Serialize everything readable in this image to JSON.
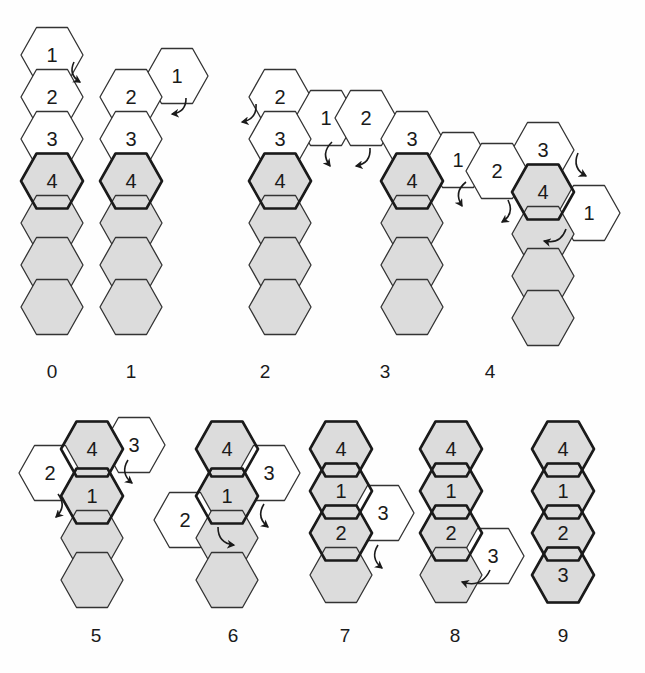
{
  "figure": {
    "background_color": "#fefefe",
    "hex": {
      "width": 62,
      "height": 55,
      "col_step": 46.5,
      "row_step": 41.5,
      "orientation": "flat-top"
    },
    "colors": {
      "shaded_fill": "#dcdcdc",
      "white_fill": "#ffffff",
      "stroke": "#333333",
      "stroke_bold": "#1a1a1a",
      "text": "#1a1a1a"
    },
    "stroke_widths": {
      "normal": 1.3,
      "bold": 2.6
    }
  },
  "panels": [
    {
      "id": "panel-0",
      "label": "0",
      "label_pos": {
        "x": 52,
        "y": 372
      },
      "hexes": [
        {
          "name": "hex-1",
          "text": "1",
          "cx": 52,
          "cy": 55,
          "fill": "white",
          "bold": false
        },
        {
          "name": "hex-2",
          "text": "2",
          "cx": 52,
          "cy": 97,
          "fill": "white",
          "bold": false
        },
        {
          "name": "hex-3",
          "text": "3",
          "cx": 52,
          "cy": 139,
          "fill": "white",
          "bold": false
        },
        {
          "name": "hex-4",
          "text": "4",
          "cx": 52,
          "cy": 181,
          "fill": "shaded",
          "bold": true
        },
        {
          "name": "hex-body-1",
          "text": "",
          "cx": 52,
          "cy": 223,
          "fill": "shaded",
          "bold": false
        },
        {
          "name": "hex-body-2",
          "text": "",
          "cx": 52,
          "cy": 265,
          "fill": "shaded",
          "bold": false
        },
        {
          "name": "hex-body-3",
          "text": "",
          "cx": 52,
          "cy": 307,
          "fill": "shaded",
          "bold": false
        }
      ],
      "arrows": [
        {
          "name": "rotation-arrow",
          "x1": 74,
          "y1": 62,
          "x2": 80,
          "y2": 82,
          "curve": "right-down"
        }
      ]
    },
    {
      "id": "panel-1",
      "label": "1",
      "label_pos": {
        "x": 131,
        "y": 372
      },
      "hexes": [
        {
          "name": "hex-1",
          "text": "1",
          "cx": 177,
          "cy": 76,
          "fill": "white",
          "bold": false
        },
        {
          "name": "hex-2",
          "text": "2",
          "cx": 131,
          "cy": 97,
          "fill": "white",
          "bold": false
        },
        {
          "name": "hex-3",
          "text": "3",
          "cx": 131,
          "cy": 139,
          "fill": "white",
          "bold": false
        },
        {
          "name": "hex-4",
          "text": "4",
          "cx": 131,
          "cy": 181,
          "fill": "shaded",
          "bold": true
        },
        {
          "name": "hex-body-1",
          "text": "",
          "cx": 131,
          "cy": 223,
          "fill": "shaded",
          "bold": false
        },
        {
          "name": "hex-body-2",
          "text": "",
          "cx": 131,
          "cy": 265,
          "fill": "shaded",
          "bold": false
        },
        {
          "name": "hex-body-3",
          "text": "",
          "cx": 131,
          "cy": 307,
          "fill": "shaded",
          "bold": false
        }
      ],
      "arrows": [
        {
          "name": "rotation-arrow",
          "x1": 186,
          "y1": 98,
          "x2": 172,
          "y2": 114,
          "curve": "left-down"
        }
      ]
    },
    {
      "id": "panel-2",
      "label": "2",
      "label_pos": {
        "x": 265,
        "y": 372
      },
      "hexes": [
        {
          "name": "hex-2",
          "text": "2",
          "cx": 280,
          "cy": 97,
          "fill": "white",
          "bold": false
        },
        {
          "name": "hex-1",
          "text": "1",
          "cx": 326,
          "cy": 118,
          "fill": "white",
          "bold": false
        },
        {
          "name": "hex-3",
          "text": "3",
          "cx": 280,
          "cy": 139,
          "fill": "white",
          "bold": false
        },
        {
          "name": "hex-4",
          "text": "4",
          "cx": 280,
          "cy": 181,
          "fill": "shaded",
          "bold": true
        },
        {
          "name": "hex-body-1",
          "text": "",
          "cx": 280,
          "cy": 223,
          "fill": "shaded",
          "bold": false
        },
        {
          "name": "hex-body-2",
          "text": "",
          "cx": 280,
          "cy": 265,
          "fill": "shaded",
          "bold": false
        },
        {
          "name": "hex-body-3",
          "text": "",
          "cx": 280,
          "cy": 307,
          "fill": "shaded",
          "bold": false
        }
      ],
      "arrows": [
        {
          "name": "rotation-arrow-left",
          "x1": 256,
          "y1": 104,
          "x2": 242,
          "y2": 122,
          "curve": "left-down"
        },
        {
          "name": "rotation-arrow-right",
          "x1": 332,
          "y1": 142,
          "x2": 330,
          "y2": 166,
          "curve": "right-down"
        }
      ]
    },
    {
      "id": "panel-3",
      "label": "3",
      "label_pos": {
        "x": 385,
        "y": 372
      },
      "hexes": [
        {
          "name": "hex-2",
          "text": "2",
          "cx": 366,
          "cy": 118,
          "fill": "white",
          "bold": false
        },
        {
          "name": "hex-3",
          "text": "3",
          "cx": 412,
          "cy": 139,
          "fill": "white",
          "bold": false
        },
        {
          "name": "hex-1",
          "text": "1",
          "cx": 458,
          "cy": 160,
          "fill": "white",
          "bold": false
        },
        {
          "name": "hex-4",
          "text": "4",
          "cx": 412,
          "cy": 181,
          "fill": "shaded",
          "bold": true
        },
        {
          "name": "hex-body-1",
          "text": "",
          "cx": 412,
          "cy": 223,
          "fill": "shaded",
          "bold": false
        },
        {
          "name": "hex-body-2",
          "text": "",
          "cx": 412,
          "cy": 265,
          "fill": "shaded",
          "bold": false
        },
        {
          "name": "hex-body-3",
          "text": "",
          "cx": 412,
          "cy": 307,
          "fill": "shaded",
          "bold": false
        }
      ],
      "arrows": [
        {
          "name": "rotation-arrow-left",
          "x1": 370,
          "y1": 148,
          "x2": 356,
          "y2": 166,
          "curve": "left-down"
        },
        {
          "name": "rotation-arrow-right",
          "x1": 466,
          "y1": 182,
          "x2": 462,
          "y2": 206,
          "curve": "right-down"
        }
      ]
    },
    {
      "id": "panel-4",
      "label": "4",
      "label_pos": {
        "x": 490,
        "y": 372
      },
      "hexes": [
        {
          "name": "hex-3",
          "text": "3",
          "cx": 543,
          "cy": 150,
          "fill": "white",
          "bold": false
        },
        {
          "name": "hex-2",
          "text": "2",
          "cx": 497,
          "cy": 171,
          "fill": "white",
          "bold": false
        },
        {
          "name": "hex-4",
          "text": "4",
          "cx": 543,
          "cy": 192,
          "fill": "shaded",
          "bold": true
        },
        {
          "name": "hex-1",
          "text": "1",
          "cx": 589,
          "cy": 213,
          "fill": "white",
          "bold": false
        },
        {
          "name": "hex-body-1",
          "text": "",
          "cx": 543,
          "cy": 234,
          "fill": "shaded",
          "bold": false
        },
        {
          "name": "hex-body-2",
          "text": "",
          "cx": 543,
          "cy": 276,
          "fill": "shaded",
          "bold": false
        },
        {
          "name": "hex-body-3",
          "text": "",
          "cx": 543,
          "cy": 318,
          "fill": "shaded",
          "bold": false
        }
      ],
      "arrows": [
        {
          "name": "rotation-arrow-right",
          "x1": 578,
          "y1": 153,
          "x2": 586,
          "y2": 176,
          "curve": "right-down"
        },
        {
          "name": "rotation-arrow-left",
          "x1": 508,
          "y1": 200,
          "x2": 502,
          "y2": 222,
          "curve": "left-down"
        },
        {
          "name": "rotation-arrow-center",
          "x1": 566,
          "y1": 229,
          "x2": 544,
          "y2": 241,
          "curve": "left-down"
        }
      ]
    },
    {
      "id": "panel-5",
      "label": "5",
      "label_pos": {
        "x": 96,
        "y": 636
      },
      "hexes": [
        {
          "name": "hex-3",
          "text": "3",
          "cx": 134,
          "cy": 445,
          "fill": "white",
          "bold": false
        },
        {
          "name": "hex-4",
          "text": "4",
          "cx": 92,
          "cy": 449,
          "fill": "shaded",
          "bold": true
        },
        {
          "name": "hex-2",
          "text": "2",
          "cx": 50,
          "cy": 473,
          "fill": "white",
          "bold": false
        },
        {
          "name": "hex-1",
          "text": "1",
          "cx": 92,
          "cy": 496,
          "fill": "shaded",
          "bold": true
        },
        {
          "name": "hex-body-1",
          "text": "",
          "cx": 92,
          "cy": 538,
          "fill": "shaded",
          "bold": false
        },
        {
          "name": "hex-body-2",
          "text": "",
          "cx": 92,
          "cy": 580,
          "fill": "shaded",
          "bold": false
        }
      ],
      "arrows": [
        {
          "name": "rotation-arrow-right",
          "x1": 128,
          "y1": 460,
          "x2": 132,
          "y2": 483,
          "curve": "right-down"
        },
        {
          "name": "rotation-arrow-left",
          "x1": 58,
          "y1": 494,
          "x2": 56,
          "y2": 517,
          "curve": "left-down"
        }
      ]
    },
    {
      "id": "panel-6",
      "label": "6",
      "label_pos": {
        "x": 233,
        "y": 636
      },
      "hexes": [
        {
          "name": "hex-4",
          "text": "4",
          "cx": 227,
          "cy": 449,
          "fill": "shaded",
          "bold": true
        },
        {
          "name": "hex-3",
          "text": "3",
          "cx": 269,
          "cy": 473,
          "fill": "white",
          "bold": false
        },
        {
          "name": "hex-1",
          "text": "1",
          "cx": 227,
          "cy": 496,
          "fill": "shaded",
          "bold": true
        },
        {
          "name": "hex-2",
          "text": "2",
          "cx": 185,
          "cy": 520,
          "fill": "white",
          "bold": false
        },
        {
          "name": "hex-body-1",
          "text": "",
          "cx": 227,
          "cy": 538,
          "fill": "shaded",
          "bold": false
        },
        {
          "name": "hex-body-2",
          "text": "",
          "cx": 227,
          "cy": 580,
          "fill": "shaded",
          "bold": false
        }
      ],
      "arrows": [
        {
          "name": "rotation-arrow-right",
          "x1": 264,
          "y1": 504,
          "x2": 268,
          "y2": 527,
          "curve": "right-down"
        },
        {
          "name": "rotation-arrow-center",
          "x1": 218,
          "y1": 527,
          "x2": 234,
          "y2": 545,
          "curve": "right-down"
        }
      ]
    },
    {
      "id": "panel-7",
      "label": "7",
      "label_pos": {
        "x": 345,
        "y": 636
      },
      "hexes": [
        {
          "name": "hex-4",
          "text": "4",
          "cx": 341,
          "cy": 449,
          "fill": "shaded",
          "bold": true
        },
        {
          "name": "hex-1",
          "text": "1",
          "cx": 341,
          "cy": 491,
          "fill": "shaded",
          "bold": true
        },
        {
          "name": "hex-3",
          "text": "3",
          "cx": 383,
          "cy": 513,
          "fill": "white",
          "bold": false
        },
        {
          "name": "hex-2",
          "text": "2",
          "cx": 341,
          "cy": 533,
          "fill": "shaded",
          "bold": true
        },
        {
          "name": "hex-body-1",
          "text": "",
          "cx": 341,
          "cy": 575,
          "fill": "shaded",
          "bold": false
        }
      ],
      "arrows": [
        {
          "name": "rotation-arrow-right",
          "x1": 378,
          "y1": 545,
          "x2": 382,
          "y2": 568,
          "curve": "right-down"
        }
      ]
    },
    {
      "id": "panel-8",
      "label": "8",
      "label_pos": {
        "x": 455,
        "y": 636
      },
      "hexes": [
        {
          "name": "hex-4",
          "text": "4",
          "cx": 451,
          "cy": 449,
          "fill": "shaded",
          "bold": true
        },
        {
          "name": "hex-1",
          "text": "1",
          "cx": 451,
          "cy": 491,
          "fill": "shaded",
          "bold": true
        },
        {
          "name": "hex-2",
          "text": "2",
          "cx": 451,
          "cy": 533,
          "fill": "shaded",
          "bold": true
        },
        {
          "name": "hex-3",
          "text": "3",
          "cx": 493,
          "cy": 556,
          "fill": "white",
          "bold": false
        },
        {
          "name": "hex-body-1",
          "text": "",
          "cx": 451,
          "cy": 575,
          "fill": "shaded",
          "bold": false
        }
      ],
      "arrows": [
        {
          "name": "rotation-arrow-center",
          "x1": 490,
          "y1": 570,
          "x2": 462,
          "y2": 582,
          "curve": "left-down"
        }
      ]
    },
    {
      "id": "panel-9",
      "label": "9",
      "label_pos": {
        "x": 563,
        "y": 636
      },
      "hexes": [
        {
          "name": "hex-4",
          "text": "4",
          "cx": 563,
          "cy": 449,
          "fill": "shaded",
          "bold": true
        },
        {
          "name": "hex-1",
          "text": "1",
          "cx": 563,
          "cy": 491,
          "fill": "shaded",
          "bold": true
        },
        {
          "name": "hex-2",
          "text": "2",
          "cx": 563,
          "cy": 533,
          "fill": "shaded",
          "bold": true
        },
        {
          "name": "hex-3",
          "text": "3",
          "cx": 563,
          "cy": 575,
          "fill": "shaded",
          "bold": true
        }
      ],
      "arrows": []
    }
  ]
}
